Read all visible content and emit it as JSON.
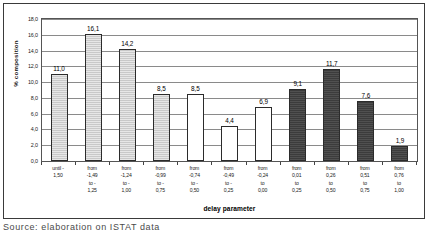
{
  "caption": "Source: elaboration on ISTAT data",
  "chart_data": {
    "type": "bar",
    "title": "",
    "xlabel": "delay parameter",
    "ylabel": "% composition",
    "ylim": [
      0,
      18
    ],
    "ytick_step": 2,
    "grid": true,
    "legend": "none",
    "ytick_labels": [
      "18,0",
      "16,0",
      "14,0",
      "12,0",
      "10,0",
      "8,0",
      "6,0",
      "4,0",
      "2,0",
      "0,0"
    ],
    "ytick_values": [
      18,
      16,
      14,
      12,
      10,
      8,
      6,
      4,
      2,
      0
    ],
    "categories": [
      "until -1,50",
      "from -1,49 to -1,25",
      "from -1,24 to -1,00",
      "from -0,99 to -0,75",
      "from -0,74 to -0,50",
      "from -0,49 to -0,25",
      "from -0,24 to 0,00",
      "from 0,01 to 0,25",
      "from 0,26 to 0,50",
      "from 0,51 to 0,75",
      "from 0,76 to 1,00"
    ],
    "category_lines": [
      [
        "until -",
        "1,50"
      ],
      [
        "from",
        "-1,49",
        "to -",
        "1,25"
      ],
      [
        "from",
        "-1,24",
        "to -",
        "1,00"
      ],
      [
        "from",
        "-0,99",
        "to -",
        "0,75"
      ],
      [
        "from",
        "-0,74",
        "to -",
        "0,50"
      ],
      [
        "from",
        "-0,49",
        "to -",
        "0,25"
      ],
      [
        "from",
        "-0,24",
        "to",
        "0,00"
      ],
      [
        "from",
        "0,01",
        "to",
        "0,25"
      ],
      [
        "from",
        "0,26",
        "to",
        "0,50"
      ],
      [
        "from",
        "0,51",
        "to",
        "0,75"
      ],
      [
        "from",
        "0,76",
        "to",
        "1,00"
      ]
    ],
    "values": [
      11.0,
      16.1,
      14.2,
      8.5,
      8.5,
      4.4,
      6.9,
      9.1,
      11.7,
      7.6,
      1.9
    ],
    "value_labels": [
      "11,0",
      "16,1",
      "14,2",
      "8,5",
      "8,5",
      "4,4",
      "6,9",
      "9,1",
      "11,7",
      "7,6",
      "1,9"
    ],
    "bar_styles": [
      "light",
      "light",
      "light",
      "light",
      "white",
      "white",
      "white",
      "dark",
      "dark",
      "dark",
      "dark"
    ],
    "colors": {
      "light": "#c9c9c9",
      "white": "#ffffff",
      "dark": "#3c3c3c",
      "outline": "#2b2b2b",
      "gridline": "#8a8a8a",
      "frame": "#3a3a3a"
    }
  }
}
